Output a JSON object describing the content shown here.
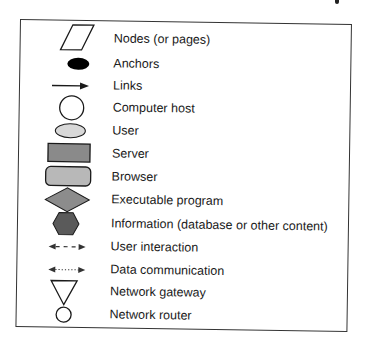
{
  "legend": {
    "items": [
      {
        "icon": "parallelogram-icon",
        "label": "Nodes (or pages)"
      },
      {
        "icon": "filled-ellipse-icon",
        "label": "Anchors"
      },
      {
        "icon": "arrow-icon",
        "label": "Links"
      },
      {
        "icon": "circle-icon",
        "label": "Computer host"
      },
      {
        "icon": "light-ellipse-icon",
        "label": "User"
      },
      {
        "icon": "rectangle-icon",
        "label": "Server"
      },
      {
        "icon": "rounded-rectangle-icon",
        "label": "Browser"
      },
      {
        "icon": "diamond-icon",
        "label": "Executable program"
      },
      {
        "icon": "hexagon-icon",
        "label": "Information (database or other content)"
      },
      {
        "icon": "dashed-double-arrow-icon",
        "label": "User interaction"
      },
      {
        "icon": "dotted-double-arrow-icon",
        "label": "Data communication"
      },
      {
        "icon": "inverted-triangle-icon",
        "label": "Network gateway"
      },
      {
        "icon": "small-circle-icon",
        "label": "Network router"
      }
    ]
  },
  "colors": {
    "outline": "#1a1a1a",
    "anchor_fill": "#000000",
    "user_fill": "#d8d8d8",
    "server_fill": "#8a8a8a",
    "browser_fill": "#b8b8b8",
    "program_fill": "#8c8c8c",
    "information_fill": "#5a5a5a"
  }
}
